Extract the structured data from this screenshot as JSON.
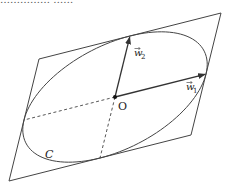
{
  "caption_fragment": "…………… ……",
  "diagram": {
    "type": "ellipse-in-parallelogram",
    "origin": {
      "label": "O",
      "x": 115,
      "y": 97
    },
    "vectors": [
      {
        "name": "w1",
        "label": "w",
        "subscript": "1",
        "dx": 91,
        "dy": -23
      },
      {
        "name": "w2",
        "label": "w",
        "subscript": "2",
        "dx": 15,
        "dy": -61
      }
    ],
    "curve_label": "C",
    "colors": {
      "stroke": "#444444",
      "background": "#ffffff"
    }
  }
}
